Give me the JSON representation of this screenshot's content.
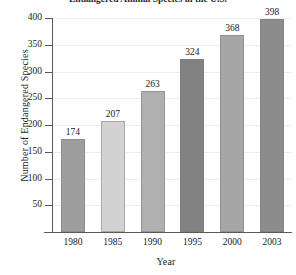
{
  "chart_data": {
    "type": "bar",
    "title": "Endangered Animal Species in the U.S.",
    "xlabel": "Year",
    "ylabel": "Number of Endangered Species",
    "categories": [
      "1980",
      "1985",
      "1990",
      "1995",
      "2000",
      "2003"
    ],
    "values": [
      174,
      207,
      263,
      324,
      368,
      398
    ],
    "ylim": [
      0,
      400
    ],
    "yticks": [
      "50",
      "100",
      "150",
      "200",
      "250",
      "300",
      "350",
      "400"
    ],
    "ytick_values": [
      50,
      100,
      150,
      200,
      250,
      300,
      350,
      400
    ],
    "grid": "horizontal",
    "legend": "none",
    "bar_colors": [
      "#9e9e9e",
      "#d2d2d2",
      "#b0b0b0",
      "#828282",
      "#a6a6a6",
      "#8c8c8c"
    ]
  },
  "axis": {
    "line_color": "#5a5a5a",
    "grid_color": "#ececec"
  }
}
